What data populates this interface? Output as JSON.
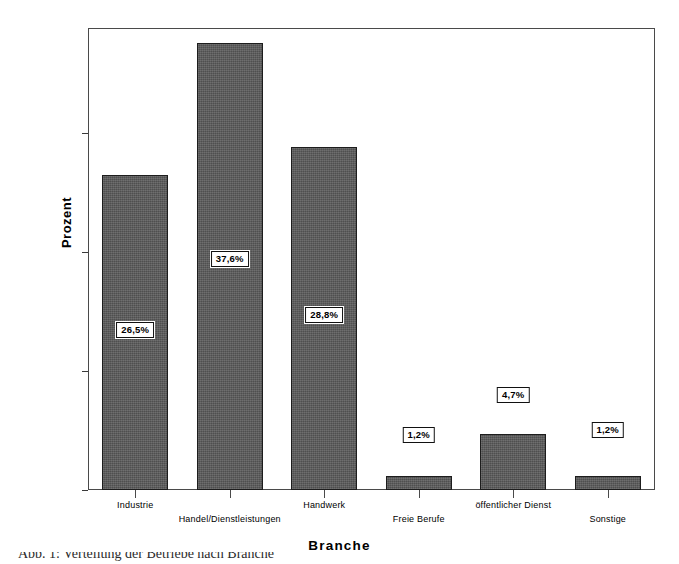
{
  "chart_data": {
    "type": "bar",
    "title": "",
    "xlabel": "Branche",
    "ylabel": "Prozent",
    "categories": [
      "Industrie",
      "Handel/Dienstleistungen",
      "Handwerk",
      "Freie Berufe",
      "öffentlicher Dienst",
      "Sonstige"
    ],
    "values": [
      26.5,
      37.6,
      28.8,
      1.2,
      4.7,
      1.2
    ],
    "value_labels": [
      "26,5%",
      "37,6%",
      "28,8%",
      "1,2%",
      "4,7%",
      "1,2%"
    ],
    "ylim": [
      0,
      38.8
    ],
    "ytick_values": [
      0,
      10,
      20,
      30
    ],
    "ytick_labels": [
      "0,0%",
      "10,0%",
      "20,0%",
      "30,0%"
    ],
    "grid": false,
    "legend": "none",
    "bar_color": "#5a5a5a",
    "bar_edge_color": "#1d1d1d",
    "frame_color": "#4a4a4a"
  },
  "axis": {
    "y_title": "Prozent",
    "x_title": "Branche"
  },
  "caption": {
    "text": "Abb. 1: Verteilung der Betriebe nach Branche"
  }
}
